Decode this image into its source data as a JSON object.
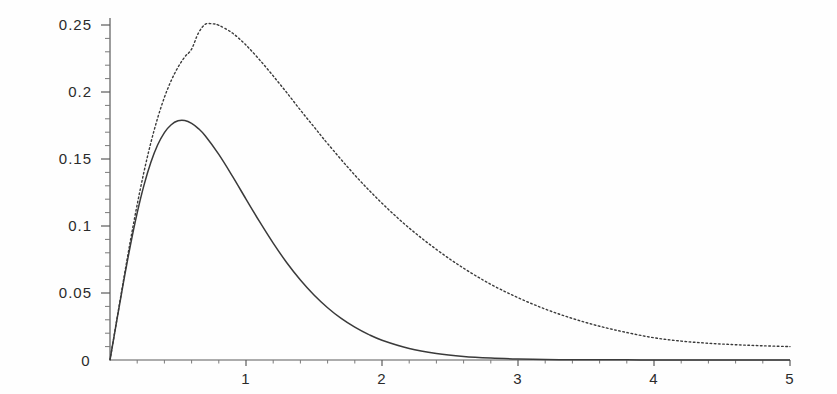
{
  "chart_data": {
    "type": "line",
    "title": "",
    "xlabel": "",
    "ylabel": "",
    "xlim": [
      0,
      5
    ],
    "ylim": [
      0,
      0.26
    ],
    "grid": false,
    "legend": "none",
    "x_ticks": [
      0,
      1,
      2,
      3,
      4,
      5
    ],
    "x_tick_labels": [
      "0",
      "1",
      "2",
      "3",
      "4",
      "5"
    ],
    "x_minor_step": 0.2,
    "y_ticks": [
      0,
      0.05,
      0.1,
      0.15,
      0.2,
      0.25
    ],
    "y_tick_labels": [
      "0",
      "0.05",
      "0.1",
      "0.15",
      "0.2",
      "0.25"
    ],
    "y_minor_step": 0.01,
    "axis_color": "#5a5a5a",
    "series": [
      {
        "name": "solid-curve",
        "style": "solid",
        "color": "#3a3a3a",
        "peak_x": 0.5,
        "peak_y": 0.185,
        "x": [
          0,
          0.05,
          0.1,
          0.15,
          0.2,
          0.25,
          0.3,
          0.35,
          0.4,
          0.45,
          0.5,
          0.55,
          0.6,
          0.65,
          0.7,
          0.8,
          0.9,
          1.0,
          1.1,
          1.2,
          1.3,
          1.4,
          1.5,
          1.6,
          1.7,
          1.8,
          1.9,
          2.0,
          2.2,
          2.4,
          2.6,
          2.8,
          3.0,
          3.2,
          3.4,
          3.6,
          3.8,
          4.0,
          4.2,
          4.4,
          4.6,
          4.8,
          5.0
        ],
        "y": [
          0,
          0.0295,
          0.0585,
          0.0856,
          0.1098,
          0.1305,
          0.1474,
          0.1604,
          0.1697,
          0.1756,
          0.1785,
          0.1787,
          0.1766,
          0.1727,
          0.1673,
          0.1534,
          0.1372,
          0.1201,
          0.1032,
          0.0872,
          0.0726,
          0.0597,
          0.0485,
          0.039,
          0.031,
          0.0245,
          0.0191,
          0.0148,
          0.0086,
          0.0049,
          0.0027,
          0.0015,
          0.0008,
          0.0004,
          0.0002,
          0.0001,
          0.0001,
          4e-05,
          2e-05,
          1e-05,
          1e-05,
          5e-06,
          2e-06
        ]
      },
      {
        "name": "dotted-curve",
        "style": "dotted",
        "color": "#3a3a3a",
        "peak_x": 0.68,
        "peak_y": 0.251,
        "x": [
          0,
          0.05,
          0.1,
          0.15,
          0.2,
          0.25,
          0.3,
          0.35,
          0.4,
          0.45,
          0.5,
          0.55,
          0.6,
          0.65,
          0.7,
          0.75,
          0.8,
          0.9,
          1.0,
          1.1,
          1.2,
          1.3,
          1.4,
          1.5,
          1.6,
          1.8,
          2.0,
          2.2,
          2.4,
          2.6,
          2.8,
          3.0,
          3.2,
          3.4,
          3.6,
          3.8,
          4.0,
          4.2,
          4.4,
          4.6,
          4.8,
          5.0
        ],
        "y": [
          0,
          0.03,
          0.06,
          0.089,
          0.116,
          0.1405,
          0.162,
          0.1805,
          0.196,
          0.2085,
          0.2185,
          0.2262,
          0.232,
          0.244,
          0.2505,
          0.2509,
          0.2498,
          0.244,
          0.235,
          0.224,
          0.212,
          0.1995,
          0.1865,
          0.174,
          0.1615,
          0.138,
          0.117,
          0.0985,
          0.0825,
          0.0685,
          0.0565,
          0.0465,
          0.038,
          0.031,
          0.0252,
          0.0205,
          0.0166,
          0.0141,
          0.0125,
          0.0114,
          0.0106,
          0.01
        ]
      }
    ]
  },
  "geometry": {
    "origin_x": 110,
    "origin_y": 360,
    "x_scale_px_per_unit": 136,
    "y_scale_px_per_unit": 1340,
    "y_axis_top": 18
  }
}
